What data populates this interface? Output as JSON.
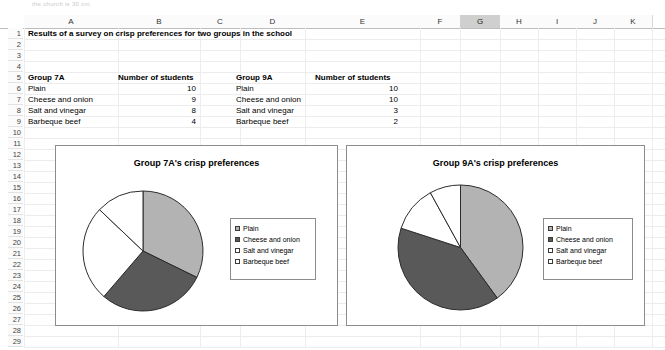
{
  "app": {
    "top_fragment": "the church is 30 cm."
  },
  "grid": {
    "columns": [
      "A",
      "B",
      "C",
      "D",
      "E",
      "F",
      "G",
      "H",
      "I",
      "J",
      "K"
    ],
    "selected_column": "G",
    "rows": [
      1,
      2,
      3,
      4,
      5,
      6,
      7,
      8,
      9,
      10,
      11,
      12,
      13,
      14,
      15,
      16,
      17,
      18,
      19,
      20,
      21,
      22,
      23,
      24,
      25,
      26,
      27,
      28,
      29
    ],
    "cells": {
      "a1": "Results of a survey on crisp preferences for two groups in the school",
      "a5": "Group 7A",
      "b5": "Number of students",
      "a6": "Plain",
      "a7": "Cheese and onion",
      "a8": "Salt and vinegar",
      "a9": "Barbeque beef",
      "b6": "10",
      "b7": "9",
      "b8": "8",
      "b9": "4",
      "d5": "Group 9A",
      "e5": "Number of students",
      "d6": "Plain",
      "d7": "Cheese and onion",
      "d8": "Salt and vinegar",
      "d9": "Barbeque beef",
      "e6": "10",
      "e7": "10",
      "e8": "3",
      "e9": "2"
    }
  },
  "colors": {
    "plain": "#b3b3b3",
    "cheese": "#595959",
    "salt": "#ffffff",
    "barbeque": "#ffffff",
    "outline": "#2b2b2b",
    "selected_header": "#cfcfcf"
  },
  "chart_data": [
    {
      "type": "pie",
      "title": "Group 7A's crisp preferences",
      "categories": [
        "Plain",
        "Cheese and onion",
        "Salt and vinegar",
        "Barbeque beef"
      ],
      "values": [
        10,
        9,
        8,
        4
      ],
      "total": 31,
      "colors": [
        "#b3b3b3",
        "#595959",
        "#ffffff",
        "#ffffff"
      ],
      "start_angle": 0,
      "legend_position": "right",
      "legend": [
        "Plain",
        "Cheese and onion",
        "Salt and vinegar",
        "Barbeque beef"
      ]
    },
    {
      "type": "pie",
      "title": "Group 9A's crisp preferences",
      "categories": [
        "Plain",
        "Cheese and onion",
        "Salt and vinegar",
        "Barbeque beef"
      ],
      "values": [
        10,
        10,
        3,
        2
      ],
      "total": 25,
      "colors": [
        "#b3b3b3",
        "#595959",
        "#ffffff",
        "#ffffff"
      ],
      "start_angle": 0,
      "legend_position": "right",
      "legend": [
        "Plain",
        "Cheese and onion",
        "Salt and vinegar",
        "Barbeque beef"
      ]
    }
  ]
}
